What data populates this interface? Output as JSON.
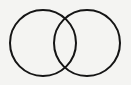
{
  "diagram": {
    "type": "venn",
    "sets": [
      {
        "id": "left-set",
        "label": "",
        "cx": 43,
        "cy": 43,
        "r": 33
      },
      {
        "id": "right-set",
        "label": "",
        "cx": 87,
        "cy": 43,
        "r": 33
      }
    ],
    "stroke_color": "#151515",
    "background_color": "#f4f4f2"
  }
}
